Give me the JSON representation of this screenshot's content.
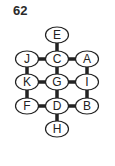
{
  "puzzle_number": "62",
  "nodes": [
    {
      "id": "E",
      "x": 57,
      "y": 35
    },
    {
      "id": "J",
      "x": 27,
      "y": 59
    },
    {
      "id": "C",
      "x": 57,
      "y": 59
    },
    {
      "id": "A",
      "x": 87,
      "y": 59
    },
    {
      "id": "K",
      "x": 27,
      "y": 82
    },
    {
      "id": "G",
      "x": 57,
      "y": 82
    },
    {
      "id": "I",
      "x": 87,
      "y": 82
    },
    {
      "id": "F",
      "x": 27,
      "y": 106
    },
    {
      "id": "D",
      "x": 57,
      "y": 106
    },
    {
      "id": "B",
      "x": 87,
      "y": 106
    },
    {
      "id": "H",
      "x": 57,
      "y": 129
    }
  ],
  "edges": [
    [
      "E",
      "C"
    ],
    [
      "J",
      "C"
    ],
    [
      "C",
      "A"
    ],
    [
      "J",
      "K"
    ],
    [
      "C",
      "G"
    ],
    [
      "A",
      "I"
    ],
    [
      "K",
      "G"
    ],
    [
      "G",
      "I"
    ],
    [
      "K",
      "F"
    ],
    [
      "G",
      "D"
    ],
    [
      "I",
      "B"
    ],
    [
      "F",
      "D"
    ],
    [
      "D",
      "B"
    ],
    [
      "D",
      "H"
    ]
  ]
}
